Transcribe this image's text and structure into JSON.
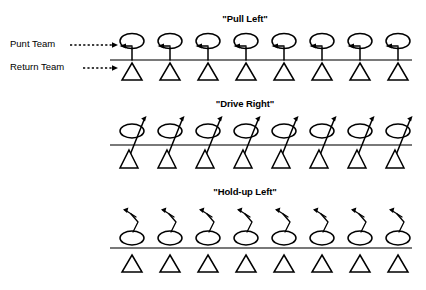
{
  "diagram": {
    "kind": "football-punt-return-formation-diagram",
    "line_color": "#4c4c4c",
    "ink_color": "#000000",
    "background": "#ffffff",
    "players_per_row": 8,
    "legend": {
      "punt_team_label": "Punt Team",
      "return_team_label": "Return Team",
      "punt_team_symbol": "oval-head-stick-figure",
      "return_team_symbol": "open-triangle"
    },
    "panels": [
      {
        "id": "pull-left",
        "title": "\"Pull Left\"",
        "punt_team_symbol": "oval-head-stick-figure",
        "return_team_symbol": "open-triangle",
        "arrow_direction": "left",
        "arrow_description": "short horizontal arrow pointing left from each punt-team player",
        "punt_player_count": 8,
        "return_player_count": 8
      },
      {
        "id": "drive-right",
        "title": "\"Drive Right\"",
        "punt_team_symbol": "slanted-oval-head-stick-figure",
        "return_team_symbol": "open-triangle",
        "arrow_direction": "up-right",
        "arrow_description": "diagonal stem slanting up and to the right ending in an arrowhead",
        "punt_player_count": 8,
        "return_player_count": 8
      },
      {
        "id": "hold-up-left",
        "title": "\"Hold-up Left\"",
        "punt_team_symbol": "oval",
        "return_team_symbol": "open-triangle",
        "arrow_direction": "up-then-left",
        "arrow_description": "zig-zag path rising from the oval then hooking to the left with an arrowhead",
        "punt_player_count": 8,
        "return_player_count": 8
      }
    ]
  }
}
